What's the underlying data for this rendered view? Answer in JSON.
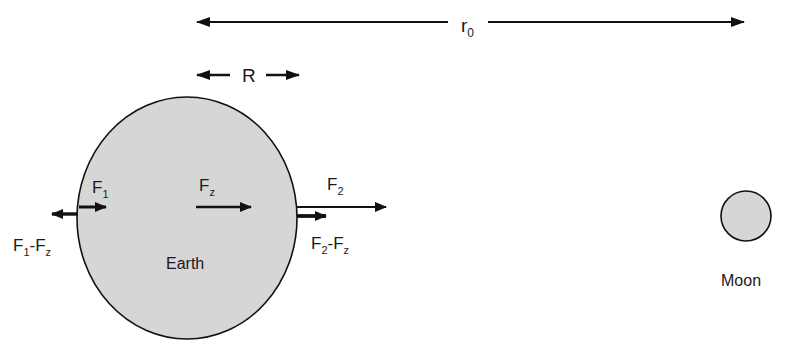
{
  "diagram": {
    "colors": {
      "body_fill": "#d6d6d6",
      "stroke": "#111111",
      "background": "#ffffff"
    },
    "distance": {
      "main": "r",
      "sub": "0"
    },
    "radius_label": "R",
    "earth": {
      "label": "Earth"
    },
    "moon": {
      "label": "Moon"
    },
    "forces": {
      "f1": {
        "main": "F",
        "sub": "1"
      },
      "fz": {
        "main": "F",
        "sub": "z"
      },
      "f2": {
        "main": "F",
        "sub": "2"
      },
      "f1_minus_fz": {
        "a_main": "F",
        "a_sub": "1",
        "sep": "-",
        "b_main": "F",
        "b_sub": "z"
      },
      "f2_minus_fz": {
        "a_main": "F",
        "a_sub": "2",
        "sep": "-",
        "b_main": "F",
        "b_sub": "z"
      }
    }
  }
}
